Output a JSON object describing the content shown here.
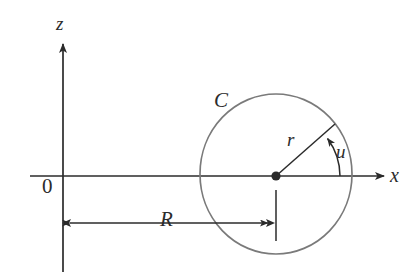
{
  "figure": {
    "background_color": "#ffffff",
    "axis_color": "#2b2b2b",
    "circle_color": "#7a7a7a",
    "label_color": "#2b2b2b",
    "width": 419,
    "height": 272
  },
  "axes": {
    "vertical": {
      "name": "z-axis",
      "label": "z",
      "x": 63,
      "y_top": 42,
      "y_bottom": 272,
      "arrow": "up"
    },
    "horizontal": {
      "name": "x-axis",
      "label": "x",
      "y": 176,
      "x_left": 30,
      "x_right": 386,
      "arrow": "right"
    },
    "origin": {
      "label": "0",
      "x": 63,
      "y": 176
    }
  },
  "circle": {
    "name": "circle-C",
    "label": "C",
    "center_x": 276,
    "center_y": 174,
    "radius_x": 76,
    "radius_y": 80,
    "stroke_width": 1.6
  },
  "radius": {
    "name": "radius-r",
    "label": "r",
    "from_x": 276,
    "from_y": 176,
    "to_x": 335,
    "to_y": 124,
    "angle_degrees": 41
  },
  "angle": {
    "name": "angle-u",
    "label": "u",
    "arc_radius": 64,
    "arrow": "counterclockwise"
  },
  "dimension": {
    "name": "dimension-R",
    "label": "R",
    "y": 223,
    "x_left": 63,
    "x_right": 275,
    "tick_x": 276,
    "tick_y_top": 190,
    "tick_y_bottom": 241
  },
  "center_dot": {
    "name": "circle-center-dot",
    "x": 276,
    "y": 176,
    "radius": 4.6
  }
}
